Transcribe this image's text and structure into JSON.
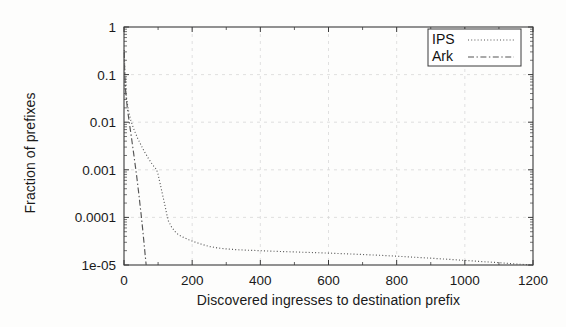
{
  "chart_data": {
    "type": "line",
    "title": "",
    "xlabel": "Discovered ingresses to destination prefix",
    "ylabel": "Fraction of prefixes",
    "xlim": [
      0,
      1200
    ],
    "ylim": [
      1e-05,
      1
    ],
    "yscale": "log",
    "xscale": "linear",
    "grid": true,
    "legend_position": "top-right",
    "xticks": [
      "0",
      "200",
      "400",
      "600",
      "800",
      "1000",
      "1200"
    ],
    "xtick_values": [
      0,
      200,
      400,
      600,
      800,
      1000,
      1200
    ],
    "yticks": [
      "1e-05",
      "0.0001",
      "0.001",
      "0.01",
      "0.1",
      "1"
    ],
    "ytick_values": [
      1e-05,
      0.0001,
      0.001,
      0.01,
      0.1,
      1
    ],
    "series": [
      {
        "name": "IPS",
        "style": "dotted",
        "color": "#555555",
        "points": [
          [
            1,
            0.33
          ],
          [
            2,
            0.125
          ],
          [
            3,
            0.085
          ],
          [
            4,
            0.062
          ],
          [
            5,
            0.048
          ],
          [
            6,
            0.04
          ],
          [
            8,
            0.03
          ],
          [
            10,
            0.024
          ],
          [
            13,
            0.018
          ],
          [
            16,
            0.014
          ],
          [
            20,
            0.011
          ],
          [
            25,
            0.0085
          ],
          [
            30,
            0.0068
          ],
          [
            35,
            0.0056
          ],
          [
            40,
            0.0046
          ],
          [
            45,
            0.0039
          ],
          [
            50,
            0.0033
          ],
          [
            55,
            0.0028
          ],
          [
            60,
            0.0024
          ],
          [
            65,
            0.0021
          ],
          [
            70,
            0.0018
          ],
          [
            75,
            0.0016
          ],
          [
            80,
            0.0014
          ],
          [
            85,
            0.00125
          ],
          [
            90,
            0.00112
          ],
          [
            95,
            0.00103
          ],
          [
            100,
            0.0008
          ],
          [
            105,
            0.00055
          ],
          [
            110,
            0.00038
          ],
          [
            115,
            0.00026
          ],
          [
            120,
            0.00018
          ],
          [
            125,
            0.00012
          ],
          [
            130,
            8.5e-05
          ],
          [
            140,
            6.2e-05
          ],
          [
            150,
            5e-05
          ],
          [
            160,
            4.3e-05
          ],
          [
            175,
            3.8e-05
          ],
          [
            190,
            3.4e-05
          ],
          [
            210,
            3e-05
          ],
          [
            230,
            2.7e-05
          ],
          [
            250,
            2.45e-05
          ],
          [
            275,
            2.28e-05
          ],
          [
            300,
            2.18e-05
          ],
          [
            330,
            2.1e-05
          ],
          [
            360,
            2.05e-05
          ],
          [
            400,
            2e-05
          ],
          [
            450,
            1.93e-05
          ],
          [
            500,
            1.88e-05
          ],
          [
            550,
            1.83e-05
          ],
          [
            600,
            1.78e-05
          ],
          [
            650,
            1.72e-05
          ],
          [
            700,
            1.66e-05
          ],
          [
            750,
            1.6e-05
          ],
          [
            800,
            1.53e-05
          ],
          [
            850,
            1.46e-05
          ],
          [
            900,
            1.39e-05
          ],
          [
            950,
            1.32e-05
          ],
          [
            1000,
            1.25e-05
          ],
          [
            1050,
            1.18e-05
          ],
          [
            1100,
            1.12e-05
          ],
          [
            1150,
            1.05e-05
          ],
          [
            1200,
            1e-05
          ]
        ]
      },
      {
        "name": "Ark",
        "style": "dash-dot",
        "color": "#555555",
        "points": [
          [
            1,
            0.3
          ],
          [
            2,
            0.115
          ],
          [
            3,
            0.078
          ],
          [
            4,
            0.056
          ],
          [
            5,
            0.043
          ],
          [
            6,
            0.035
          ],
          [
            8,
            0.026
          ],
          [
            10,
            0.0195
          ],
          [
            12,
            0.015
          ],
          [
            14,
            0.0118
          ],
          [
            16,
            0.0094
          ],
          [
            18,
            0.0074
          ],
          [
            20,
            0.0059
          ],
          [
            22,
            0.0047
          ],
          [
            24,
            0.0037
          ],
          [
            26,
            0.0029
          ],
          [
            28,
            0.0023
          ],
          [
            30,
            0.0018
          ],
          [
            32,
            0.0014
          ],
          [
            34,
            0.0011
          ],
          [
            36,
            0.00086
          ],
          [
            38,
            0.00066
          ],
          [
            40,
            0.0005
          ],
          [
            42,
            0.00038
          ],
          [
            44,
            0.00029
          ],
          [
            46,
            0.000215
          ],
          [
            48,
            0.00016
          ],
          [
            50,
            0.00012
          ],
          [
            52,
            8.8e-05
          ],
          [
            54,
            6.4e-05
          ],
          [
            56,
            4.6e-05
          ],
          [
            58,
            3.3e-05
          ],
          [
            60,
            2.35e-05
          ],
          [
            62,
            1.65e-05
          ],
          [
            64,
            1.2e-05
          ],
          [
            65,
            1e-05
          ]
        ]
      }
    ]
  },
  "legend": {
    "entries": [
      {
        "label": "IPS"
      },
      {
        "label": "Ark"
      }
    ]
  },
  "colors": {
    "background": "#fdfdfc",
    "axis": "#3a3a3a",
    "grid": "#d8d8d8",
    "text": "#1a1a1a",
    "curve": "#555555"
  }
}
